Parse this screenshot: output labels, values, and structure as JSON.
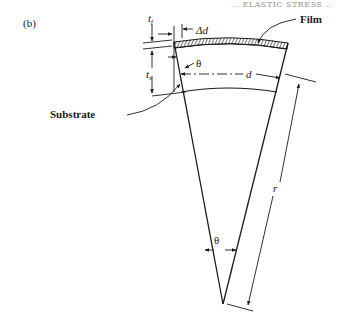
{
  "figure": {
    "panel_label": "(b)",
    "header_fragment": "… ELASTIC STRESS …",
    "labels": {
      "film": "Film",
      "substrate": "Substrate",
      "film_thickness": "t",
      "film_thickness_sub": "f",
      "substrate_thickness": "t",
      "substrate_thickness_sub": "s",
      "delta_d": "Δd",
      "theta_top": "θ",
      "theta_apex": "θ",
      "length_d": "d",
      "radius_r": "r"
    },
    "colors": {
      "line": "#1a1a1a",
      "background": "#ffffff"
    }
  }
}
